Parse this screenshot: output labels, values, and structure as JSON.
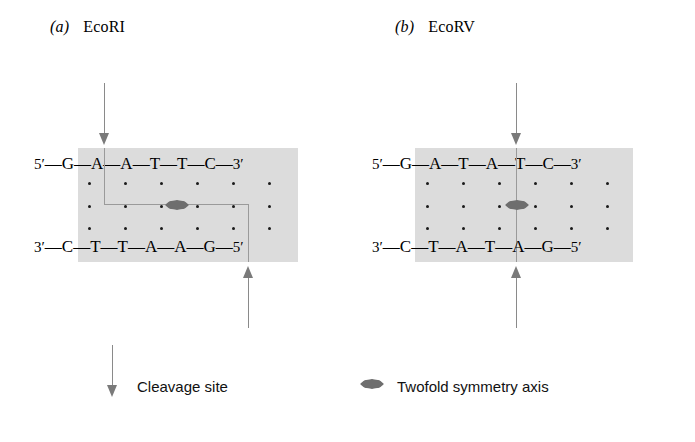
{
  "figure": {
    "panels": [
      {
        "id": "a",
        "index_label": "(a)",
        "enzyme": "EcoRI",
        "cut_type": "staggered",
        "top_strand": {
          "five_prime": "5′",
          "three_prime": "3′",
          "bases": [
            "G",
            "A",
            "A",
            "T",
            "T",
            "C"
          ]
        },
        "bottom_strand": {
          "three_prime": "3′",
          "five_prime": "5′",
          "bases": [
            "C",
            "T",
            "T",
            "A",
            "A",
            "G"
          ]
        },
        "top_cut_after_base_index": 1,
        "bottom_cut_after_base_index": 5
      },
      {
        "id": "b",
        "index_label": "(b)",
        "enzyme": "EcoRV",
        "cut_type": "blunt",
        "top_strand": {
          "five_prime": "5′",
          "three_prime": "3′",
          "bases": [
            "G",
            "A",
            "T",
            "A",
            "T",
            "C"
          ]
        },
        "bottom_strand": {
          "three_prime": "3′",
          "five_prime": "5′",
          "bases": [
            "C",
            "T",
            "A",
            "T",
            "A",
            "G"
          ]
        },
        "top_cut_after_base_index": 3,
        "bottom_cut_after_base_index": 3
      }
    ],
    "legend": [
      {
        "marker": "down-arrow-icon",
        "label": "Cleavage site"
      },
      {
        "marker": "lens-ellipse-icon",
        "label": "Twofold symmetry axis"
      }
    ],
    "colors": {
      "shade": "#dcdcdc",
      "arrow": "#7a7a7a",
      "cut_line": "#9a9a9a",
      "symmetry_axis": "#6e6e6e",
      "text": "#000000"
    },
    "base_separator": "—"
  }
}
